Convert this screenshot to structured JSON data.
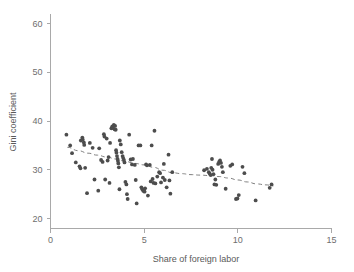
{
  "chart_data": {
    "type": "scatter",
    "title": "",
    "xlabel": "Share of foreign labor",
    "ylabel": "Gini coefficient",
    "xlim": [
      0,
      15
    ],
    "ylim": [
      20,
      62
    ],
    "xticks": [
      0,
      5,
      10,
      15
    ],
    "yticks": [
      20,
      30,
      40,
      50,
      60
    ],
    "xticklabels": [
      "0",
      "5",
      "10",
      "15"
    ],
    "yticklabels": [
      "20",
      "30",
      "40",
      "50",
      "60"
    ],
    "grid": false,
    "legend": null,
    "point_color": "#4d4d4d",
    "point_radius": 1.9,
    "trend_color": "#808080",
    "trend_style": "dashed",
    "trend_note": "LOWESS-style smoothed fit, decreasing from about 34.6 at x=0.9 to about 26.7 at x=11.9",
    "points": [
      [
        0.85,
        37.2
      ],
      [
        1.05,
        35.0
      ],
      [
        1.15,
        33.4
      ],
      [
        1.35,
        31.5
      ],
      [
        1.55,
        30.7
      ],
      [
        1.6,
        30.3
      ],
      [
        1.62,
        36.0
      ],
      [
        1.7,
        36.6
      ],
      [
        1.72,
        36.2
      ],
      [
        1.78,
        35.6
      ],
      [
        1.8,
        35.1
      ],
      [
        1.85,
        30.4
      ],
      [
        1.95,
        25.2
      ],
      [
        2.1,
        35.5
      ],
      [
        2.25,
        34.5
      ],
      [
        2.35,
        28.0
      ],
      [
        2.55,
        25.7
      ],
      [
        2.6,
        34.4
      ],
      [
        2.7,
        32.0
      ],
      [
        2.78,
        31.6
      ],
      [
        2.85,
        37.3
      ],
      [
        2.88,
        36.8
      ],
      [
        2.92,
        28.0
      ],
      [
        3.0,
        36.4
      ],
      [
        3.05,
        31.9
      ],
      [
        3.1,
        32.6
      ],
      [
        3.15,
        27.3
      ],
      [
        3.18,
        35.5
      ],
      [
        3.25,
        38.5
      ],
      [
        3.3,
        38.9
      ],
      [
        3.34,
        38.6
      ],
      [
        3.38,
        39.2
      ],
      [
        3.42,
        38.3
      ],
      [
        3.45,
        39.0
      ],
      [
        3.48,
        38.2
      ],
      [
        3.5,
        34.0
      ],
      [
        3.52,
        33.5
      ],
      [
        3.55,
        32.8
      ],
      [
        3.58,
        32.2
      ],
      [
        3.6,
        31.8
      ],
      [
        3.62,
        31.3
      ],
      [
        3.65,
        30.5
      ],
      [
        3.68,
        26.0
      ],
      [
        3.7,
        36.0
      ],
      [
        3.75,
        35.2
      ],
      [
        3.8,
        33.6
      ],
      [
        3.85,
        32.8
      ],
      [
        3.88,
        32.4
      ],
      [
        3.92,
        32.0
      ],
      [
        3.95,
        31.5
      ],
      [
        4.0,
        27.5
      ],
      [
        4.05,
        27.0
      ],
      [
        4.08,
        25.0
      ],
      [
        4.12,
        24.0
      ],
      [
        4.2,
        37.2
      ],
      [
        4.28,
        32.1
      ],
      [
        4.35,
        31.1
      ],
      [
        4.4,
        32.2
      ],
      [
        4.5,
        31.0
      ],
      [
        4.55,
        27.9
      ],
      [
        4.6,
        23.1
      ],
      [
        4.7,
        35.0
      ],
      [
        4.8,
        35.0
      ],
      [
        4.85,
        26.4
      ],
      [
        4.9,
        26.0
      ],
      [
        4.95,
        25.7
      ],
      [
        5.0,
        25.6
      ],
      [
        5.02,
        25.5
      ],
      [
        5.05,
        26.2
      ],
      [
        5.1,
        31.1
      ],
      [
        5.15,
        30.9
      ],
      [
        5.2,
        24.7
      ],
      [
        5.3,
        31.0
      ],
      [
        5.35,
        27.6
      ],
      [
        5.4,
        35.0
      ],
      [
        5.45,
        28.1
      ],
      [
        5.5,
        27.3
      ],
      [
        5.55,
        38.0
      ],
      [
        5.6,
        27.2
      ],
      [
        5.7,
        28.6
      ],
      [
        5.8,
        29.5
      ],
      [
        5.85,
        29.3
      ],
      [
        5.9,
        27.4
      ],
      [
        6.0,
        28.4
      ],
      [
        6.05,
        31.2
      ],
      [
        6.1,
        27.9
      ],
      [
        6.2,
        26.4
      ],
      [
        6.3,
        33.1
      ],
      [
        6.35,
        27.8
      ],
      [
        6.4,
        25.1
      ],
      [
        6.5,
        29.5
      ],
      [
        8.2,
        29.9
      ],
      [
        8.35,
        30.2
      ],
      [
        8.45,
        29.5
      ],
      [
        8.5,
        29.2
      ],
      [
        8.55,
        28.9
      ],
      [
        8.58,
        30.4
      ],
      [
        8.62,
        32.2
      ],
      [
        8.65,
        30.0
      ],
      [
        8.7,
        29.1
      ],
      [
        8.75,
        27.0
      ],
      [
        8.8,
        28.0
      ],
      [
        8.85,
        26.9
      ],
      [
        8.95,
        31.2
      ],
      [
        9.0,
        31.6
      ],
      [
        9.05,
        31.9
      ],
      [
        9.1,
        31.4
      ],
      [
        9.15,
        30.6
      ],
      [
        9.2,
        29.5
      ],
      [
        9.35,
        26.1
      ],
      [
        9.6,
        30.8
      ],
      [
        9.7,
        31.1
      ],
      [
        9.9,
        24.0
      ],
      [
        9.98,
        24.1
      ],
      [
        10.05,
        24.8
      ],
      [
        10.25,
        30.6
      ],
      [
        10.35,
        29.3
      ],
      [
        10.95,
        23.7
      ],
      [
        11.7,
        26.3
      ],
      [
        11.8,
        27.0
      ]
    ],
    "trend_points": [
      [
        0.9,
        34.6
      ],
      [
        1.5,
        33.9
      ],
      [
        2.0,
        33.4
      ],
      [
        2.5,
        33.0
      ],
      [
        3.0,
        32.6
      ],
      [
        3.5,
        32.2
      ],
      [
        4.0,
        31.7
      ],
      [
        4.5,
        31.3
      ],
      [
        5.0,
        31.0
      ],
      [
        5.5,
        30.5
      ],
      [
        6.0,
        29.9
      ],
      [
        6.5,
        29.4
      ],
      [
        7.0,
        29.2
      ],
      [
        7.5,
        29.0
      ],
      [
        8.0,
        28.9
      ],
      [
        8.5,
        28.8
      ],
      [
        9.0,
        28.6
      ],
      [
        9.5,
        28.3
      ],
      [
        10.0,
        27.9
      ],
      [
        10.5,
        27.5
      ],
      [
        11.0,
        27.1
      ],
      [
        11.5,
        26.9
      ],
      [
        11.9,
        26.7
      ]
    ]
  }
}
